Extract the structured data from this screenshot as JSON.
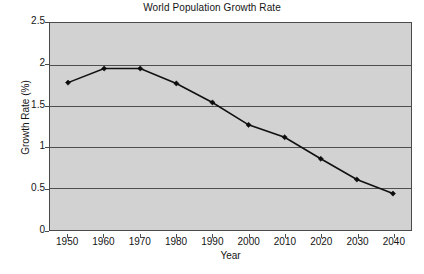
{
  "chart_data": {
    "type": "line",
    "title": "World Population Growth Rate",
    "xlabel": "Year",
    "ylabel": "Growth Rate (%)",
    "x": [
      1950,
      1960,
      1970,
      1980,
      1990,
      2000,
      2010,
      2020,
      2030,
      2040
    ],
    "values": [
      1.78,
      1.95,
      1.95,
      1.77,
      1.54,
      1.27,
      1.12,
      0.86,
      0.61,
      0.44
    ],
    "xtick_labels": [
      "1950",
      "1960",
      "1970",
      "1980",
      "1990",
      "2000",
      "2010",
      "2020",
      "2030",
      "2040"
    ],
    "ytick_labels": [
      "0",
      "0.5",
      "1",
      "1.5",
      "2",
      "2.5"
    ],
    "ytick_values": [
      0,
      0.5,
      1,
      1.5,
      2,
      2.5
    ],
    "xlim": [
      1945,
      2045
    ],
    "ylim": [
      0,
      2.5
    ],
    "grid": "horizontal",
    "legend": "none",
    "marker": "diamond",
    "colors": {
      "plot_background": "#d2d2d2",
      "page_background": "#ffffff",
      "gridline": "#4d4d4d",
      "axis_border": "#4a4a4a",
      "series_line": "#111111",
      "marker_fill": "#0d0d0d",
      "text": "#141414"
    }
  }
}
